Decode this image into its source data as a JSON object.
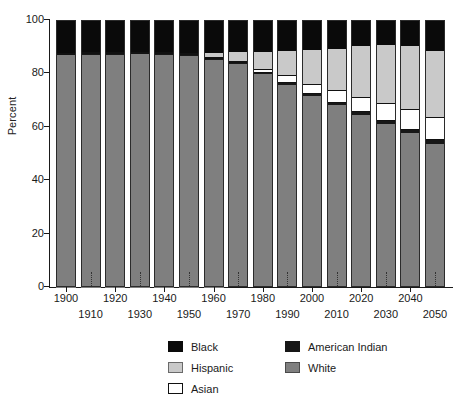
{
  "chart_data": {
    "type": "bar",
    "subtype": "stacked-bar-100-percent",
    "title": "",
    "xlabel": "",
    "ylabel": "Percent",
    "ylim": [
      0,
      100
    ],
    "yticks": [
      0,
      20,
      40,
      60,
      80,
      100
    ],
    "grid": false,
    "legend_position": "bottom-center",
    "legend_columns": 2,
    "categories": [
      "1900",
      "1910",
      "1920",
      "1930",
      "1940",
      "1950",
      "1960",
      "1970",
      "1980",
      "1990",
      "2000",
      "2010",
      "2020",
      "2030",
      "2040",
      "2050"
    ],
    "stack_order_bottom_to_top": [
      "White",
      "American Indian",
      "Asian",
      "Hispanic",
      "Black"
    ],
    "series": [
      {
        "name": "White",
        "color": "#7f7f7f",
        "values": [
          87.3,
          87.4,
          87.6,
          87.7,
          87.4,
          87.0,
          85.4,
          83.5,
          79.6,
          75.7,
          71.4,
          68.0,
          64.3,
          60.9,
          57.5,
          53.7
        ]
      },
      {
        "name": "American Indian",
        "color": "#171717",
        "values": [
          0.3,
          0.3,
          0.3,
          0.3,
          0.3,
          0.3,
          0.4,
          0.4,
          0.6,
          0.8,
          0.9,
          1.0,
          1.1,
          1.1,
          1.2,
          1.2
        ]
      },
      {
        "name": "Asian",
        "color": "#ffffff",
        "values": [
          0.2,
          0.2,
          0.2,
          0.2,
          0.2,
          0.2,
          0.5,
          0.8,
          1.6,
          2.9,
          3.9,
          4.8,
          5.8,
          6.8,
          7.8,
          8.9
        ]
      },
      {
        "name": "Hispanic",
        "color": "#c9c9c9",
        "values": [
          0.0,
          0.0,
          0.0,
          0.0,
          0.0,
          0.0,
          1.5,
          3.5,
          6.4,
          9.0,
          12.6,
          15.5,
          18.9,
          21.7,
          23.9,
          24.5
        ]
      },
      {
        "name": "Black",
        "color": "#0a0a0a",
        "values": [
          12.2,
          12.1,
          11.9,
          11.8,
          12.1,
          12.5,
          12.2,
          11.8,
          11.8,
          11.6,
          11.2,
          10.7,
          9.9,
          9.5,
          9.6,
          11.7
        ]
      }
    ],
    "legend_entries": [
      {
        "label": "Black",
        "color": "#0a0a0a"
      },
      {
        "label": "American Indian",
        "color": "#171717"
      },
      {
        "label": "Hispanic",
        "color": "#c9c9c9"
      },
      {
        "label": "White",
        "color": "#7f7f7f"
      },
      {
        "label": "Asian",
        "color": "#ffffff"
      }
    ]
  },
  "axis": {
    "y_title": "Percent",
    "y_tick_labels": [
      "0",
      "20",
      "40",
      "60",
      "80",
      "100"
    ],
    "x_tick_labels_upper": [
      "1900",
      "1920",
      "1940",
      "1960",
      "1980",
      "2000",
      "2020",
      "2040"
    ],
    "x_tick_labels_lower": [
      "1910",
      "1930",
      "1950",
      "1970",
      "1990",
      "2010",
      "2030",
      "2050"
    ]
  },
  "legend": {
    "column_left": [
      "Black",
      "Hispanic",
      "Asian"
    ],
    "column_right": [
      "American Indian",
      "White"
    ]
  }
}
